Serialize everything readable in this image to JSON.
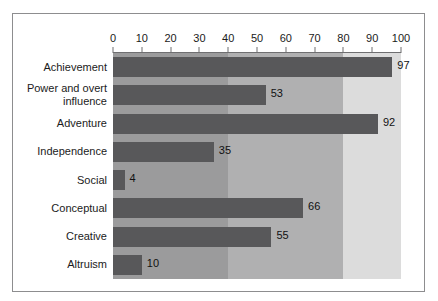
{
  "chart_data": {
    "type": "bar",
    "orientation": "horizontal",
    "title": "",
    "subtitle": "",
    "xlabel": "",
    "ylabel": "",
    "xlim": [
      0,
      100
    ],
    "ylim": null,
    "grid": false,
    "legend": null,
    "legend_position": "none",
    "categories": [
      "Achievement",
      "Power and overt influence",
      "Adventure",
      "Independence",
      "Social",
      "Conceptual",
      "Creative",
      "Altruism"
    ],
    "values": [
      97,
      53,
      92,
      35,
      4,
      66,
      55,
      10
    ],
    "data_labels": [
      "97",
      "53",
      "92",
      "35",
      "4",
      "66",
      "55",
      "10"
    ],
    "x_ticks": [
      0,
      10,
      20,
      30,
      40,
      50,
      60,
      70,
      80,
      90,
      100
    ],
    "x_tick_labels": [
      "0",
      "10",
      "20",
      "30",
      "40",
      "50",
      "60",
      "70",
      "80",
      "90",
      "100"
    ],
    "background_bands": [
      {
        "from": 0,
        "to": 40,
        "color": "#9b9b9c"
      },
      {
        "from": 40,
        "to": 80,
        "color": "#b0b0b1"
      },
      {
        "from": 80,
        "to": 100,
        "color": "#dcdcdc"
      }
    ],
    "bar_color": "#58585a",
    "axis_color": "#6f6f71",
    "border_color": "#8d8d8f",
    "text_color": "#1b1b1b"
  },
  "category_label_lines": [
    [
      "Achievement"
    ],
    [
      "Power and overt",
      "influence"
    ],
    [
      "Adventure"
    ],
    [
      "Independence"
    ],
    [
      "Social"
    ],
    [
      "Conceptual"
    ],
    [
      "Creative"
    ],
    [
      "Altruism"
    ]
  ]
}
